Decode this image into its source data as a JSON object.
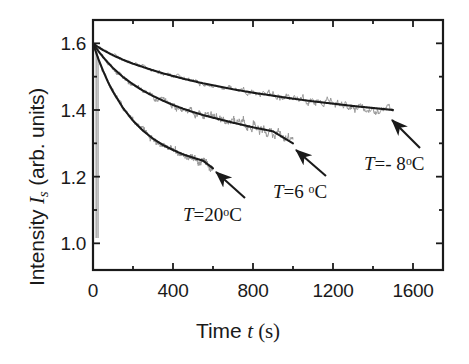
{
  "figure": {
    "background_color": "#ffffff",
    "axis_color": "#1a1a1a",
    "data_color": "#9a9a9a",
    "fit_color": "#1a1a1a"
  },
  "chart_data": {
    "type": "line",
    "title": "",
    "xlabel_parts": {
      "pre": "Time ",
      "symbol": "t",
      "post": " (s)"
    },
    "ylabel_parts": {
      "pre": "Intensity ",
      "symbol": "I",
      "subscript": "s",
      "post": " (arb. units)"
    },
    "xlabel": "Time t (s)",
    "ylabel": "Intensity Is (arb. units)",
    "xlim": [
      0,
      1750
    ],
    "ylim": [
      0.92,
      1.67
    ],
    "xticks": [
      0,
      400,
      800,
      1200,
      1600
    ],
    "xtick_labels": [
      "0",
      "400",
      "800",
      "1200",
      "1600"
    ],
    "x_minor_ticks": [
      200,
      600,
      1000,
      1400
    ],
    "yticks": [
      1.0,
      1.2,
      1.4,
      1.6
    ],
    "ytick_labels": [
      "1.0",
      "1.2",
      "1.4",
      "1.6"
    ],
    "y_minor_ticks": [
      1.1,
      1.3,
      1.5
    ],
    "grid": false,
    "legend_position": "inline-annotations",
    "series": [
      {
        "name": "T = - 8 °C",
        "label_parts": {
          "symbol": "T",
          "eq": "=",
          "value": "- 8",
          "unit": "C"
        },
        "x": [
          0,
          25,
          50,
          75,
          100,
          150,
          200,
          250,
          300,
          350,
          400,
          450,
          500,
          550,
          600,
          700,
          800,
          900,
          1000,
          1100,
          1200,
          1300,
          1400,
          1500
        ],
        "y": [
          1.6,
          1.589,
          1.58,
          1.572,
          1.564,
          1.551,
          1.539,
          1.529,
          1.519,
          1.51,
          1.502,
          1.494,
          1.487,
          1.48,
          1.474,
          1.462,
          1.452,
          1.443,
          1.434,
          1.426,
          1.419,
          1.412,
          1.406,
          1.4
        ],
        "t_end": 1500,
        "y_start": 1.6,
        "y_end": 1.4,
        "noise_amplitude": 0.012
      },
      {
        "name": "T = 6 °C",
        "label_parts": {
          "symbol": "T",
          "eq": "=",
          "value": "6",
          "unit": "C"
        },
        "x": [
          0,
          25,
          50,
          75,
          100,
          150,
          200,
          250,
          300,
          350,
          400,
          450,
          500,
          550,
          600,
          700,
          800,
          900,
          1000
        ],
        "y": [
          1.6,
          1.578,
          1.559,
          1.542,
          1.526,
          1.499,
          1.477,
          1.458,
          1.442,
          1.428,
          1.415,
          1.404,
          1.394,
          1.385,
          1.377,
          1.362,
          1.348,
          1.336,
          1.3
        ],
        "t_end": 1000,
        "y_start": 1.6,
        "y_end": 1.3,
        "noise_amplitude": 0.014
      },
      {
        "name": "T = 20 °C",
        "label_parts": {
          "symbol": "T",
          "eq": "=",
          "value": "20",
          "unit": "C"
        },
        "x": [
          0,
          25,
          50,
          75,
          100,
          150,
          200,
          250,
          300,
          350,
          400,
          450,
          500,
          550,
          600
        ],
        "y": [
          1.6,
          1.556,
          1.518,
          1.484,
          1.455,
          1.406,
          1.368,
          1.338,
          1.314,
          1.295,
          1.28,
          1.267,
          1.257,
          1.248,
          1.225
        ],
        "t_end": 600,
        "y_start": 1.6,
        "y_end": 1.225,
        "noise_amplitude": 0.012
      }
    ],
    "annotations": [
      {
        "text": "T = - 8 °C",
        "for_series": 0
      },
      {
        "text": "T = 6 °C",
        "for_series": 1
      },
      {
        "text": "T = 20 °C",
        "for_series": 2
      }
    ]
  },
  "axis_labels": {
    "y_title_pre": "Intensity ",
    "y_title_sym": "I",
    "y_title_sub": "s",
    "y_title_post": " (arb. units)",
    "x_title_pre": "Time ",
    "x_title_sym": "t",
    "x_title_post": " (s)"
  },
  "series_labels": {
    "minus8": {
      "sym": "T",
      "eq": "=",
      "val": "- 8",
      "deg": "o",
      "unit": "C"
    },
    "six": {
      "sym": "T",
      "eq": "=",
      "val": "6 ",
      "deg": "o",
      "unit": "C"
    },
    "twenty": {
      "sym": "T",
      "eq": "=",
      "val": "20",
      "deg": "o",
      "unit": "C"
    }
  }
}
